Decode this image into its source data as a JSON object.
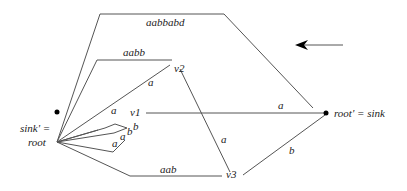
{
  "diagram": {
    "nodes": {
      "left": {
        "label_line1": "sink' =",
        "label_line2": "root"
      },
      "right": {
        "label": "root' = sink"
      },
      "v1": {
        "label": "v1"
      },
      "v2": {
        "label": "v2"
      },
      "v3": {
        "label": "v3"
      }
    },
    "edges": {
      "top": "aabbabd",
      "to_v2_top": "aabb",
      "to_v2_a": "a",
      "v1_loop_a": "a",
      "v1_right_a": "a",
      "v1_loop_b1": "b",
      "v1_loop_b2": "b",
      "v1_loop_a2": "a",
      "v1_loop_a3": "a",
      "to_v3": "aab",
      "v2_v3": "a",
      "v3_right": "b"
    },
    "arrow_direction": "left"
  }
}
